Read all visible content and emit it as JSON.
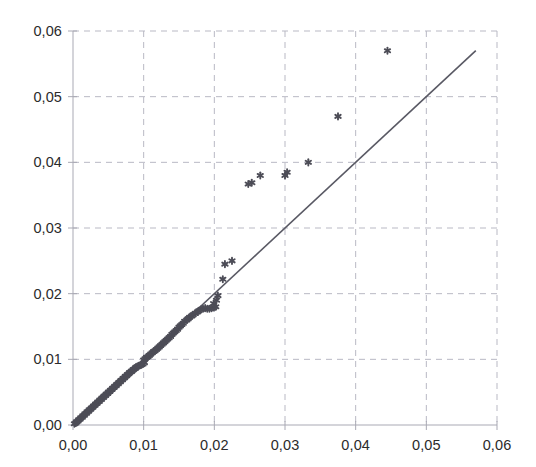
{
  "chart_data": {
    "type": "scatter",
    "title": "",
    "xlabel": "",
    "ylabel": "",
    "xlim": [
      0,
      0.06
    ],
    "ylim": [
      0,
      0.06
    ],
    "grid": true,
    "legend": false,
    "decimal_separator": ",",
    "xticks": [
      "0,00",
      "0,01",
      "0,02",
      "0,03",
      "0,04",
      "0,05",
      "0,06"
    ],
    "yticks": [
      "0,00",
      "0,01",
      "0,02",
      "0,03",
      "0,04",
      "0,05",
      "0,06"
    ],
    "xtick_values": [
      0.0,
      0.01,
      0.02,
      0.03,
      0.04,
      0.05,
      0.06
    ],
    "ytick_values": [
      0.0,
      0.01,
      0.02,
      0.03,
      0.04,
      0.05,
      0.06
    ],
    "marker": "asterisk",
    "marker_color": "#4d4d57",
    "line_color": "#595964",
    "grid_color": "#b9b9c4",
    "axis_color": "#a9a9b4",
    "reference_line": {
      "name": "identity-line",
      "x": [
        0.0,
        0.057
      ],
      "y": [
        0.0,
        0.057
      ]
    },
    "series": [
      {
        "name": "observations",
        "points": [
          [
            0.0002,
            0.0002
          ],
          [
            0.0004,
            0.0003
          ],
          [
            0.0005,
            0.0005
          ],
          [
            0.0007,
            0.0006
          ],
          [
            0.0008,
            0.0008
          ],
          [
            0.001,
            0.0009
          ],
          [
            0.0011,
            0.0011
          ],
          [
            0.0013,
            0.0012
          ],
          [
            0.0014,
            0.0014
          ],
          [
            0.0016,
            0.0015
          ],
          [
            0.0017,
            0.0017
          ],
          [
            0.0019,
            0.0018
          ],
          [
            0.002,
            0.002
          ],
          [
            0.0022,
            0.0021
          ],
          [
            0.0023,
            0.0023
          ],
          [
            0.0025,
            0.0024
          ],
          [
            0.0026,
            0.0026
          ],
          [
            0.0028,
            0.0027
          ],
          [
            0.0029,
            0.0029
          ],
          [
            0.0031,
            0.003
          ],
          [
            0.0032,
            0.0032
          ],
          [
            0.0034,
            0.0033
          ],
          [
            0.0035,
            0.0035
          ],
          [
            0.0037,
            0.0036
          ],
          [
            0.0038,
            0.0038
          ],
          [
            0.004,
            0.0039
          ],
          [
            0.0041,
            0.0041
          ],
          [
            0.0043,
            0.0042
          ],
          [
            0.0044,
            0.0044
          ],
          [
            0.0046,
            0.0045
          ],
          [
            0.0047,
            0.0047
          ],
          [
            0.0049,
            0.0048
          ],
          [
            0.005,
            0.005
          ],
          [
            0.0052,
            0.0051
          ],
          [
            0.0053,
            0.0053
          ],
          [
            0.0055,
            0.0054
          ],
          [
            0.0056,
            0.0056
          ],
          [
            0.0058,
            0.0057
          ],
          [
            0.0059,
            0.0059
          ],
          [
            0.0061,
            0.006
          ],
          [
            0.0062,
            0.0062
          ],
          [
            0.0064,
            0.0063
          ],
          [
            0.0065,
            0.0065
          ],
          [
            0.0067,
            0.0066
          ],
          [
            0.0068,
            0.0068
          ],
          [
            0.007,
            0.0069
          ],
          [
            0.0071,
            0.0071
          ],
          [
            0.0073,
            0.0072
          ],
          [
            0.0074,
            0.0074
          ],
          [
            0.0076,
            0.0075
          ],
          [
            0.0077,
            0.0077
          ],
          [
            0.0079,
            0.0078
          ],
          [
            0.008,
            0.008
          ],
          [
            0.0082,
            0.0081
          ],
          [
            0.0083,
            0.0082
          ],
          [
            0.0085,
            0.0084
          ],
          [
            0.0086,
            0.0085
          ],
          [
            0.0088,
            0.0086
          ],
          [
            0.0089,
            0.0088
          ],
          [
            0.0091,
            0.0089
          ],
          [
            0.0093,
            0.009
          ],
          [
            0.0095,
            0.0091
          ],
          [
            0.0097,
            0.0092
          ],
          [
            0.0099,
            0.0093
          ],
          [
            0.0101,
            0.0095
          ],
          [
            0.01,
            0.0099
          ],
          [
            0.0102,
            0.0101
          ],
          [
            0.0104,
            0.0103
          ],
          [
            0.0106,
            0.0104
          ],
          [
            0.0108,
            0.0106
          ],
          [
            0.011,
            0.0108
          ],
          [
            0.0112,
            0.011
          ],
          [
            0.0114,
            0.0112
          ],
          [
            0.0116,
            0.0113
          ],
          [
            0.0118,
            0.0115
          ],
          [
            0.012,
            0.0117
          ],
          [
            0.0122,
            0.0119
          ],
          [
            0.0124,
            0.0121
          ],
          [
            0.0126,
            0.0123
          ],
          [
            0.0128,
            0.0125
          ],
          [
            0.013,
            0.0127
          ],
          [
            0.0132,
            0.0129
          ],
          [
            0.0134,
            0.0131
          ],
          [
            0.0136,
            0.0133
          ],
          [
            0.0138,
            0.0135
          ],
          [
            0.014,
            0.0138
          ],
          [
            0.0142,
            0.014
          ],
          [
            0.0144,
            0.0142
          ],
          [
            0.0146,
            0.0144
          ],
          [
            0.0148,
            0.0146
          ],
          [
            0.015,
            0.0149
          ],
          [
            0.0152,
            0.0151
          ],
          [
            0.0154,
            0.0153
          ],
          [
            0.0156,
            0.0155
          ],
          [
            0.0158,
            0.0158
          ],
          [
            0.0161,
            0.016
          ],
          [
            0.0163,
            0.0162
          ],
          [
            0.0165,
            0.0164
          ],
          [
            0.0168,
            0.0166
          ],
          [
            0.017,
            0.0168
          ],
          [
            0.0173,
            0.017
          ],
          [
            0.0176,
            0.0172
          ],
          [
            0.0178,
            0.0174
          ],
          [
            0.0181,
            0.0176
          ],
          [
            0.0184,
            0.0177
          ],
          [
            0.0187,
            0.0178
          ],
          [
            0.019,
            0.0177
          ],
          [
            0.0193,
            0.0177
          ],
          [
            0.0196,
            0.0178
          ],
          [
            0.0199,
            0.0179
          ],
          [
            0.0202,
            0.018
          ],
          [
            0.0199,
            0.0185
          ],
          [
            0.0203,
            0.019
          ],
          [
            0.0205,
            0.0197
          ],
          [
            0.0212,
            0.0222
          ],
          [
            0.0215,
            0.0245
          ],
          [
            0.0225,
            0.025
          ],
          [
            0.0248,
            0.0367
          ],
          [
            0.0253,
            0.0369
          ],
          [
            0.0265,
            0.038
          ],
          [
            0.03,
            0.038
          ],
          [
            0.0303,
            0.0385
          ],
          [
            0.0333,
            0.04
          ],
          [
            0.0375,
            0.047
          ],
          [
            0.0445,
            0.057
          ]
        ]
      }
    ]
  },
  "axes": {
    "geometry": {
      "left": 73,
      "right": 497,
      "top": 31,
      "bottom": 425
    }
  }
}
